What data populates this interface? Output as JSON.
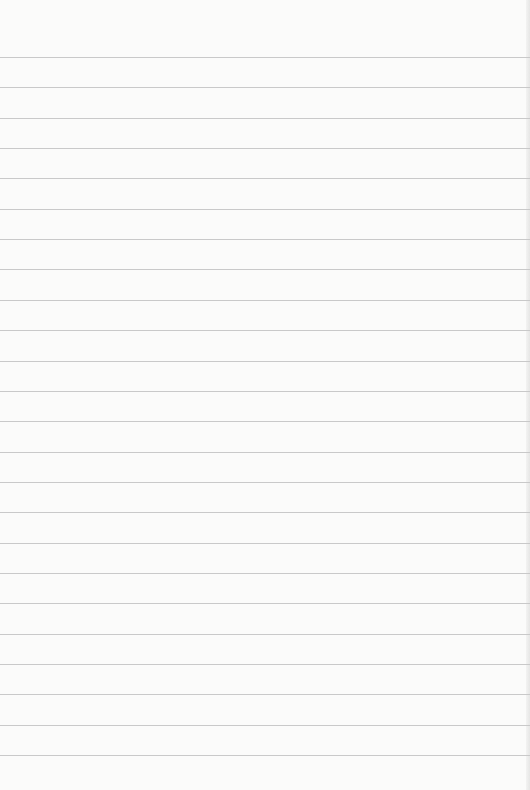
{
  "paper": {
    "type": "ruled-notepad",
    "background_color": "#fbfbfa",
    "line_color": "#c9c9c9",
    "first_line_y": 57,
    "line_spacing": 30.35,
    "line_count": 24
  }
}
